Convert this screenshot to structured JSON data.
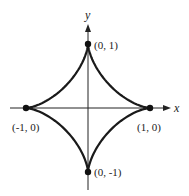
{
  "figure": {
    "axes": {
      "x_label": "x",
      "y_label": "y"
    },
    "points": [
      {
        "id": "top",
        "label": "(0, 1)",
        "x": 0,
        "y": 1
      },
      {
        "id": "left",
        "label": "(-1, 0)",
        "x": -1,
        "y": 0
      },
      {
        "id": "right",
        "label": "(1, 0)",
        "x": 1,
        "y": 0
      },
      {
        "id": "bottom",
        "label": "(0, -1)",
        "x": 0,
        "y": -1
      }
    ],
    "colors": {
      "curve": "#1a1a1a",
      "axis": "#222222",
      "background": "#ffffff"
    }
  }
}
